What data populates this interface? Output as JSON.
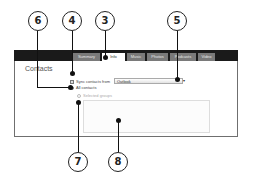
{
  "tabs": [
    {
      "label": "Summary",
      "active": false
    },
    {
      "label": "Info",
      "active": true
    },
    {
      "label": "Music",
      "active": false
    },
    {
      "label": "Photos",
      "active": false
    },
    {
      "label": "Podcasts",
      "active": false
    },
    {
      "label": "Video",
      "active": false
    }
  ],
  "section": {
    "title": "Contacts"
  },
  "sync": {
    "label": "Sync contacts from",
    "checked": true,
    "source": "Outlook"
  },
  "options": {
    "all_contacts": "All contacts",
    "selected_groups": "Selected groups"
  },
  "callouts": [
    "6",
    "4",
    "3",
    "5",
    "7",
    "8"
  ]
}
